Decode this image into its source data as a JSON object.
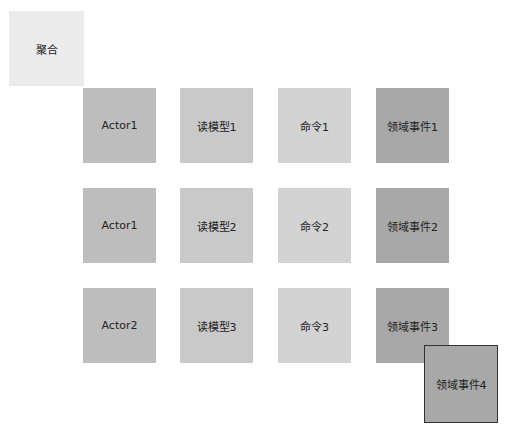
{
  "aggregate": {
    "label": "聚合"
  },
  "rows": [
    {
      "actor": "Actor1",
      "read_model": "读模型1",
      "command": "命令1",
      "event": "领域事件1"
    },
    {
      "actor": "Actor1",
      "read_model": "读模型2",
      "command": "命令2",
      "event": "领域事件2"
    },
    {
      "actor": "Actor2",
      "read_model": "读模型3",
      "command": "命令3",
      "event": "领域事件3"
    }
  ],
  "floating_event": {
    "label": "领域事件4"
  },
  "colors": {
    "aggregate": "#ebebeb",
    "actor": "#bdbdbd",
    "read_model": "#c9c9c9",
    "command": "#d3d3d3",
    "event": "#a8a8a8"
  }
}
